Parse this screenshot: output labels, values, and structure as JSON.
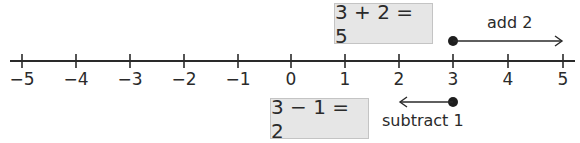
{
  "number_line": {
    "min": -5,
    "max": 5,
    "ticks": [
      "−5",
      "−4",
      "−3",
      "−2",
      "−1",
      "0",
      "1",
      "2",
      "3",
      "4",
      "5"
    ]
  },
  "addition": {
    "equation": "3 + 2 = 5",
    "label": "add 2",
    "start": 3,
    "end": 5
  },
  "subtraction": {
    "equation": "3 − 1 = 2",
    "label": "subtract 1",
    "start": 3,
    "end": 2
  },
  "colors": {
    "line": "#2a2a2a",
    "box_fill": "#e6e6e6",
    "box_border": "#c4c4c4"
  }
}
